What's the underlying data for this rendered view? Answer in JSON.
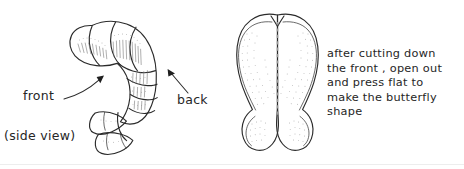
{
  "figure": {
    "width": 464,
    "height": 169,
    "background_color": "#ffffff",
    "ink_color": "#2b2b2b",
    "cut_line_color": "#9a9a9a",
    "base_rule_color": "#ededed"
  },
  "left_panel": {
    "subject": "prawn-side-view",
    "caption": "(side view)",
    "labels": {
      "front": "front",
      "back": "back"
    },
    "annotations": [
      {
        "name": "front-arrow",
        "label": "front",
        "points_to": "underside of prawn body"
      },
      {
        "name": "back-arrow",
        "label": "back",
        "points_to": "outer curve of prawn body"
      }
    ]
  },
  "right_panel": {
    "subject": "butterflied-prawn",
    "cut_line": "dashed centre line",
    "instructions_lines": [
      "after cutting down",
      "the front , open out",
      "and press  flat  to",
      "make  the butterfly",
      "shape"
    ],
    "instructions_text": "after cutting down the front , open out and press flat to make the butterfly shape"
  }
}
